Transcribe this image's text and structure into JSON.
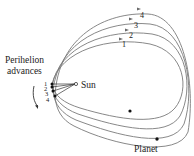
{
  "diagram": {
    "title_label": "Perihelion advances",
    "title_line1": "Perihelion",
    "title_line2": "advances",
    "sun_label": "Sun",
    "planet_label": "Planet",
    "perihelion_labels": [
      "1",
      "2",
      "3",
      "4"
    ],
    "orbit_labels": [
      "1",
      "2",
      "3",
      "4"
    ],
    "colors": {
      "orbit": "#7a7a7a",
      "text": "#222222",
      "dot": "#111111"
    }
  }
}
